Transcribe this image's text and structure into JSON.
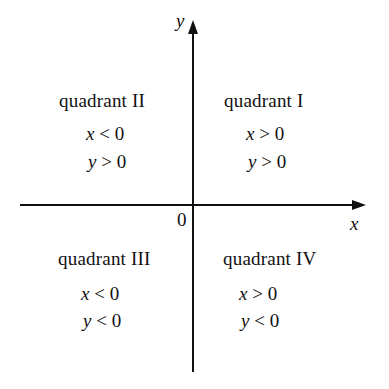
{
  "axes": {
    "x_label": "x",
    "y_label": "y",
    "origin_label": "0"
  },
  "quadrants": [
    {
      "name": "quadrant I",
      "cond_x": {
        "var": "x",
        "op": ">",
        "val": "0"
      },
      "cond_y": {
        "var": "y",
        "op": ">",
        "val": "0"
      }
    },
    {
      "name": "quadrant II",
      "cond_x": {
        "var": "x",
        "op": "<",
        "val": "0"
      },
      "cond_y": {
        "var": "y",
        "op": ">",
        "val": "0"
      }
    },
    {
      "name": "quadrant III",
      "cond_x": {
        "var": "x",
        "op": "<",
        "val": "0"
      },
      "cond_y": {
        "var": "y",
        "op": "<",
        "val": "0"
      }
    },
    {
      "name": "quadrant IV",
      "cond_x": {
        "var": "x",
        "op": ">",
        "val": "0"
      },
      "cond_y": {
        "var": "y",
        "op": "<",
        "val": "0"
      }
    }
  ],
  "colors": {
    "ink": "#111111",
    "background": "#ffffff"
  }
}
